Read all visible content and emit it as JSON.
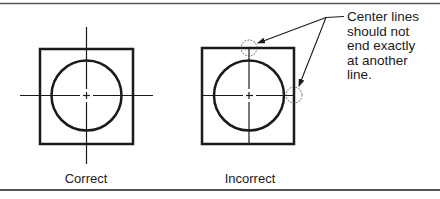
{
  "figure": {
    "left": {
      "caption": "Correct"
    },
    "right": {
      "caption": "Incorrect"
    },
    "note": {
      "lines": [
        "Center lines",
        "should not",
        "end exactly",
        "at another",
        "line."
      ]
    }
  },
  "colors": {
    "ink": "#1a1a1a",
    "border": "#555555"
  }
}
